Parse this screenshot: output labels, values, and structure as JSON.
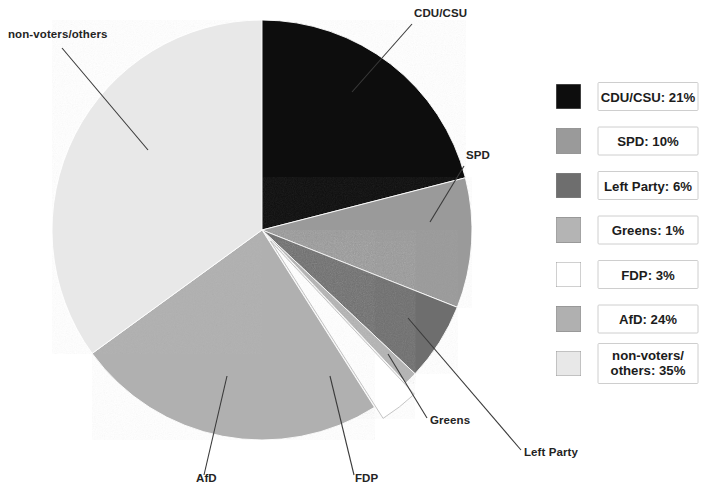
{
  "chart_data": {
    "type": "pie",
    "title": "",
    "subtitle": "",
    "xlabel": "",
    "ylabel": "",
    "legend_position": "right",
    "grid": false,
    "units": "%",
    "start_angle_deg": 0,
    "direction": "clockwise",
    "categories": [
      "CDU/CSU",
      "SPD",
      "Left Party",
      "Greens",
      "FDP",
      "AfD",
      "non-voters/others"
    ],
    "values": [
      21,
      10,
      6,
      1,
      3,
      24,
      35
    ],
    "colors": [
      "#101010",
      "#9a9a9a",
      "#6e6e6e",
      "#b4b4b4",
      "#ffffff",
      "#b0b0b0",
      "#e8e8e8"
    ],
    "exploded": [
      "FDP"
    ],
    "annotations": [
      "CDU/CSU",
      "SPD",
      "Left Party",
      "Greens",
      "FDP",
      "AfD",
      "non-voters/others"
    ]
  },
  "callouts": [
    {
      "id": "cdu-csu",
      "label": "CDU/CSU",
      "text_x": 414,
      "text_y": 17,
      "anchor": "start",
      "line_x1": 412,
      "line_y1": 24,
      "line_x2": 352,
      "line_y2": 92
    },
    {
      "id": "spd",
      "label": "SPD",
      "text_x": 466,
      "text_y": 159,
      "anchor": "start",
      "line_x1": 464,
      "line_y1": 166,
      "line_x2": 430,
      "line_y2": 222
    },
    {
      "id": "left-party",
      "label": "Left Party",
      "text_x": 524,
      "text_y": 456,
      "anchor": "start",
      "line_x1": 521,
      "line_y1": 450,
      "line_x2": 408,
      "line_y2": 318
    },
    {
      "id": "greens",
      "label": "Greens",
      "text_x": 430,
      "text_y": 424,
      "anchor": "start",
      "line_x1": 427,
      "line_y1": 418,
      "line_x2": 388,
      "line_y2": 354
    },
    {
      "id": "fdp",
      "label": "FDP",
      "text_x": 355,
      "text_y": 482,
      "anchor": "start",
      "line_x1": 354,
      "line_y1": 475,
      "line_x2": 330,
      "line_y2": 376
    },
    {
      "id": "afd",
      "label": "AfD",
      "text_x": 196,
      "text_y": 482,
      "anchor": "start",
      "line_x1": 204,
      "line_y1": 475,
      "line_x2": 227,
      "line_y2": 376
    },
    {
      "id": "non-voters-others",
      "label": "non-voters/others",
      "text_x": 8,
      "text_y": 38,
      "anchor": "start",
      "line_x1": 62,
      "line_y1": 48,
      "line_x2": 148,
      "line_y2": 150
    }
  ],
  "legend": {
    "entries": [
      {
        "id": "cdu-csu",
        "text": "CDU/CSU: 21%",
        "text2": "",
        "swatch": "#101010"
      },
      {
        "id": "spd",
        "text": "SPD: 10%",
        "text2": "",
        "swatch": "#9a9a9a"
      },
      {
        "id": "left-party",
        "text": "Left Party: 6%",
        "text2": "",
        "swatch": "#6e6e6e"
      },
      {
        "id": "greens",
        "text": "Greens: 1%",
        "text2": "",
        "swatch": "#b4b4b4"
      },
      {
        "id": "fdp",
        "text": "FDP: 3%",
        "text2": "",
        "swatch": "#ffffff"
      },
      {
        "id": "afd",
        "text": "AfD: 24%",
        "text2": "",
        "swatch": "#b0b0b0"
      },
      {
        "id": "non-voters-others",
        "text": "non-voters/",
        "text2": "others: 35%",
        "swatch": "#e8e8e8"
      }
    ]
  },
  "geometry": {
    "center_x": 262,
    "center_y": 230,
    "radius": 210,
    "explode_offset": 14
  },
  "style": {
    "background": "#ffffff",
    "text_color": "#1c1c1c",
    "leader_color": "#3a3a3a",
    "legend_border": "#c8c8c8"
  }
}
